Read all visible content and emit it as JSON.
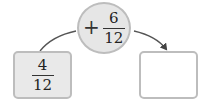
{
  "operation": {
    "sign": "+",
    "numerator": "6",
    "denominator": "12"
  },
  "start_box": {
    "numerator": "4",
    "denominator": "12"
  },
  "result_box": {
    "numerator": "",
    "denominator": ""
  },
  "colors": {
    "circle_fill": "#e6e6e6",
    "border": "#bdbdbd",
    "start_fill": "#e9e9e9",
    "result_fill": "#ffffff",
    "arrow": "#444444"
  }
}
